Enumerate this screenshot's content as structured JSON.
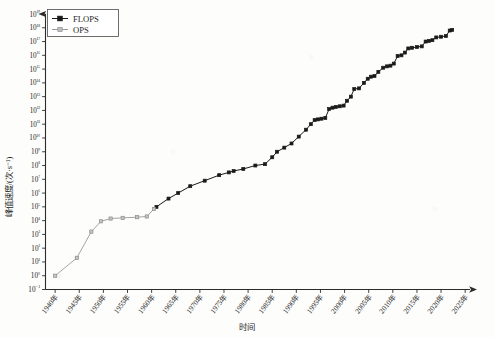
{
  "chart_data": {
    "type": "line",
    "title": "",
    "xlabel": "时间",
    "ylabel": "峰值速度/(次·s⁻¹)",
    "yscale": "log",
    "ylim": [
      -1,
      19
    ],
    "xlim": [
      1938,
      2026
    ],
    "grid": false,
    "legend_position": "top-left",
    "y_tick_labels": [
      "10⁻¹",
      "10⁰",
      "10¹",
      "10²",
      "10³",
      "10⁴",
      "10⁵",
      "10⁶",
      "10⁷",
      "10⁸",
      "10⁹",
      "10¹⁰",
      "10¹¹",
      "10¹²",
      "10¹³",
      "10¹⁴",
      "10¹⁵",
      "10¹⁶",
      "10¹⁷",
      "10¹⁸",
      "10¹⁹"
    ],
    "y_tick_exponents": [
      -1,
      0,
      1,
      2,
      3,
      4,
      5,
      6,
      7,
      8,
      9,
      10,
      11,
      12,
      13,
      14,
      15,
      16,
      17,
      18,
      19
    ],
    "x_tick_labels": [
      "1940年",
      "1945年",
      "1950年",
      "1955年",
      "1960年",
      "1965年",
      "1970年",
      "1975年",
      "1980年",
      "1985年",
      "1990年",
      "1995年",
      "2000年",
      "2005年",
      "2010年",
      "2015年",
      "2020年",
      "2025年"
    ],
    "x_tick_values": [
      1940,
      1945,
      1950,
      1955,
      1960,
      1965,
      1970,
      1975,
      1980,
      1985,
      1990,
      1995,
      2000,
      2005,
      2010,
      2015,
      2020,
      2025
    ],
    "series": [
      {
        "name": "FLOPS",
        "color": "#1a1a1a",
        "marker": "square-filled",
        "points": [
          [
            1961.0,
            5.0
          ],
          [
            1963.5,
            5.6
          ],
          [
            1965.5,
            6.0
          ],
          [
            1968.0,
            6.5
          ],
          [
            1971.0,
            6.9
          ],
          [
            1974.0,
            7.3
          ],
          [
            1976.0,
            7.5
          ],
          [
            1977.0,
            7.6
          ],
          [
            1979.0,
            7.75
          ],
          [
            1981.5,
            8.0
          ],
          [
            1983.5,
            8.1
          ],
          [
            1985.0,
            8.6
          ],
          [
            1986.0,
            9.0
          ],
          [
            1987.5,
            9.3
          ],
          [
            1989.0,
            9.6
          ],
          [
            1990.5,
            10.1
          ],
          [
            1992.0,
            10.6
          ],
          [
            1993.0,
            11.0
          ],
          [
            1993.8,
            11.3
          ],
          [
            1994.5,
            11.35
          ],
          [
            1995.2,
            11.4
          ],
          [
            1996.0,
            11.45
          ],
          [
            1996.8,
            12.1
          ],
          [
            1997.5,
            12.2
          ],
          [
            1998.2,
            12.25
          ],
          [
            1999.0,
            12.3
          ],
          [
            1999.8,
            12.35
          ],
          [
            2000.5,
            12.7
          ],
          [
            2001.3,
            13.0
          ],
          [
            2002.0,
            13.55
          ],
          [
            2003.0,
            13.6
          ],
          [
            2004.0,
            14.0
          ],
          [
            2004.8,
            14.3
          ],
          [
            2005.5,
            14.45
          ],
          [
            2006.2,
            14.5
          ],
          [
            2007.0,
            14.8
          ],
          [
            2008.0,
            15.1
          ],
          [
            2008.8,
            15.2
          ],
          [
            2009.5,
            15.25
          ],
          [
            2010.2,
            15.4
          ],
          [
            2011.0,
            15.95
          ],
          [
            2011.8,
            16.0
          ],
          [
            2012.5,
            16.2
          ],
          [
            2013.2,
            16.5
          ],
          [
            2014.0,
            16.55
          ],
          [
            2015.0,
            16.6
          ],
          [
            2016.0,
            16.65
          ],
          [
            2016.8,
            17.0
          ],
          [
            2017.5,
            17.05
          ],
          [
            2018.2,
            17.1
          ],
          [
            2019.0,
            17.3
          ],
          [
            2020.0,
            17.35
          ],
          [
            2021.0,
            17.4
          ],
          [
            2021.8,
            17.8
          ],
          [
            2022.3,
            17.85
          ]
        ]
      },
      {
        "name": "OPS",
        "color": "#9a9a9a",
        "marker": "square-open",
        "points": [
          [
            1940.0,
            0.0
          ],
          [
            1944.5,
            1.3
          ],
          [
            1947.5,
            3.2
          ],
          [
            1949.5,
            3.95
          ],
          [
            1951.5,
            4.15
          ],
          [
            1954.0,
            4.2
          ],
          [
            1957.0,
            4.25
          ],
          [
            1959.0,
            4.3
          ],
          [
            1960.5,
            4.85
          ]
        ]
      }
    ]
  },
  "legend": {
    "entries": [
      {
        "label": "FLOPS"
      },
      {
        "label": "OPS"
      }
    ]
  },
  "axes": {
    "x_title": "时间",
    "y_title": "峰值速度/(次·s⁻¹)"
  }
}
